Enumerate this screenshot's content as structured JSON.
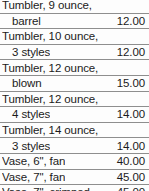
{
  "table": {
    "name": "product-price-list",
    "columns": [
      "Item",
      "Price"
    ],
    "rows": [
      {
        "line1": "Tumbler, 9 ounce,",
        "line2": "barrel",
        "price": "12.00"
      },
      {
        "line1": "Tumbler, 10 ounce,",
        "line2": "3 styles",
        "price": "12.00"
      },
      {
        "line1": "Tumbler, 12 ounce,",
        "line2": "blown",
        "price": "15.00"
      },
      {
        "line1": "Tumbler, 12 ounce,",
        "line2": "4 styles",
        "price": "14.00"
      },
      {
        "line1": "Tumbler, 14 ounce,",
        "line2": "3 styles",
        "price": "14.00"
      },
      {
        "line1": "Vase, 6\", fan",
        "line2": "",
        "price": "40.00"
      },
      {
        "line1": "Vase, 7\", fan",
        "line2": "",
        "price": "45.00"
      },
      {
        "line1": "Vase, 7\", crimped",
        "line2": "",
        "price": "45.00"
      }
    ]
  },
  "colors": {
    "text": "#1b1b1b",
    "rule": "#8e8e8e",
    "background": "#fdfdfd"
  }
}
